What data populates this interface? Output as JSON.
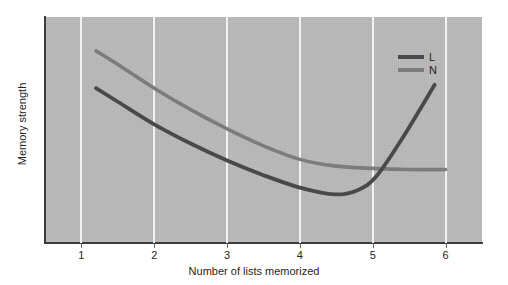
{
  "chart_data": {
    "type": "line",
    "title": "",
    "xlabel": "Number of lists memorized",
    "ylabel": "Memory strength",
    "xlim": [
      0.5,
      6.5
    ],
    "ylim": [
      0,
      10
    ],
    "xticks": [
      "1",
      "2",
      "3",
      "4",
      "5",
      "6"
    ],
    "yticks": [],
    "grid": "vertical-only",
    "legend_position": "top-right-inside",
    "plot_background": "#b9b9b9",
    "series": [
      {
        "name": "L",
        "color": "#494949",
        "x": [
          1.2,
          1.5,
          2.0,
          2.5,
          3.0,
          3.5,
          4.0,
          4.48,
          4.8,
          5.05,
          5.4,
          5.85
        ],
        "y": [
          6.85,
          6.25,
          5.25,
          4.4,
          3.65,
          3.0,
          2.45,
          2.15,
          2.35,
          2.95,
          4.6,
          7.0
        ]
      },
      {
        "name": "N",
        "color": "#7c7c7c",
        "x": [
          1.2,
          1.5,
          2.0,
          2.5,
          3.0,
          3.5,
          4.0,
          4.5,
          5.0,
          5.5,
          6.0
        ],
        "y": [
          8.5,
          7.9,
          6.85,
          5.9,
          5.05,
          4.3,
          3.7,
          3.4,
          3.3,
          3.25,
          3.25
        ]
      }
    ],
    "annotations": {
      "crossing_point_x": 5.05,
      "l_minimum_x": 4.48
    }
  },
  "legend": {
    "items": [
      {
        "label": "L",
        "color": "#494949"
      },
      {
        "label": "N",
        "color": "#7c7c7c"
      }
    ]
  },
  "axes": {
    "x_label": "Number of lists memorized",
    "y_label": "Memory strength",
    "x_tick_labels": [
      "1",
      "2",
      "3",
      "4",
      "5",
      "6"
    ]
  }
}
